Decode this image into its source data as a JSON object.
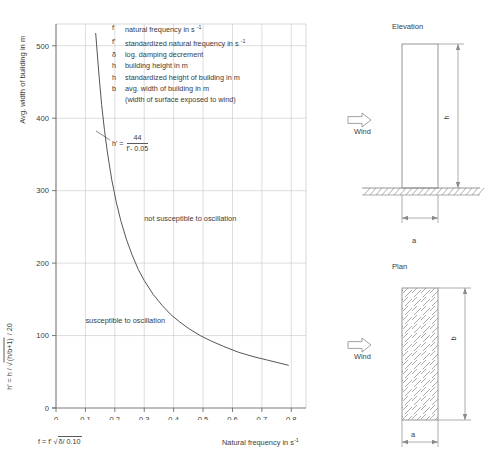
{
  "chart_data": {
    "type": "line",
    "title": "",
    "xlabel": "Natural frequency  in s⁻¹",
    "ylabel": "Avg. width of building in m",
    "y_axis_secondary_label": "h' = h / √[(h/b+1) / 20]",
    "x_axis_secondary_label": "f = f' √δ/ 0.10",
    "xlim": [
      0,
      0.85
    ],
    "ylim": [
      0,
      530
    ],
    "xticks": [
      "0",
      "0.1",
      "0.2",
      "0.3",
      "0.4",
      "0.5",
      "0.6",
      "0.7",
      "0.8"
    ],
    "xtick_values": [
      0,
      0.1,
      0.2,
      0.3,
      0.4,
      0.5,
      0.6,
      0.7,
      0.8
    ],
    "yticks": [
      "0",
      "100",
      "200",
      "300",
      "400",
      "500"
    ],
    "ytick_values": [
      0,
      100,
      200,
      300,
      400,
      500
    ],
    "grid": true,
    "legend_position": "inside-top-right",
    "equation": "h' = 44 / (f' - 0.05)",
    "series": [
      {
        "name": "h' = 44 / (f' - 0.05)",
        "color": "#555555",
        "x": [
          0.135,
          0.145,
          0.155,
          0.165,
          0.175,
          0.19,
          0.205,
          0.22,
          0.24,
          0.26,
          0.28,
          0.3,
          0.33,
          0.36,
          0.39,
          0.42,
          0.45,
          0.49,
          0.53,
          0.57,
          0.62,
          0.67,
          0.72,
          0.79
        ],
        "y": [
          517,
          465,
          419,
          383,
          352,
          314,
          284,
          259,
          232,
          210,
          191,
          176,
          157,
          142,
          129,
          119,
          110,
          100,
          92,
          85,
          77,
          71,
          66,
          59
        ]
      }
    ],
    "annotations": [
      {
        "name": "not-susceptible-region",
        "text": "not susceptible to oscillation",
        "x": 0.3,
        "y": 262
      },
      {
        "name": "susceptible-region",
        "text": "susceptible to oscillation",
        "x": 0.1,
        "y": 122
      },
      {
        "name": "curve-equation",
        "text": "h' = 44 / (f' - 0.05)",
        "x": 0.195,
        "y": 345
      }
    ]
  },
  "legend": {
    "items": [
      {
        "symbol": "f",
        "description": "natural frequency in s",
        "exponent": "-1"
      },
      {
        "symbol": "f'",
        "description": "standardized natural frequency in s",
        "exponent": "-1"
      },
      {
        "symbol": "δ",
        "description": "log. damping decrement",
        "exponent": ""
      },
      {
        "symbol": "h",
        "description": "building height in m",
        "exponent": ""
      },
      {
        "symbol": "h",
        "description": "standardized height of building in m",
        "exponent": ""
      },
      {
        "symbol": "b",
        "description": "avg. width of building in m",
        "exponent": ""
      },
      {
        "symbol": "",
        "description": "(width of surface exposed to wind)",
        "exponent": ""
      }
    ]
  },
  "equation_callout": {
    "lhs": "h' =",
    "numerator": "44",
    "denominator": "f'- 0.05"
  },
  "regions": {
    "not_susceptible": "not susceptible to oscillation",
    "susceptible": "susceptible to oscillation"
  },
  "axis": {
    "y_title": "Avg. width of building in m",
    "y_formula_prefix": "h' = h / ",
    "y_formula_radicand": "(h/b+1)",
    "y_formula_suffix": " / 20",
    "x_title": "Natural frequency  in s",
    "x_title_exponent": "-1",
    "x_formula_prefix": "f = f' ",
    "x_formula_radicand": "δ/ 0.10"
  },
  "diagrams": {
    "elevation": {
      "title": "Elevation",
      "wind_label": "Wind",
      "height_label": "h",
      "width_label": "a"
    },
    "plan": {
      "title": "Plan",
      "wind_label": "Wind",
      "depth_label": "b",
      "width_label": "a"
    }
  },
  "colors": {
    "curve": "#555555",
    "grid": "#cfcfcf",
    "axis": "#6b6b6b",
    "text": "#3b3b3b",
    "outline": "#8a8a8a"
  }
}
